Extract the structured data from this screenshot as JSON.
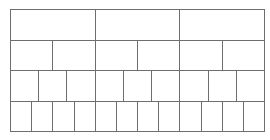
{
  "diagram": {
    "type": "subdivision-grid",
    "line_color": "#6e6e6e",
    "background": "#ffffff",
    "rows": [
      {
        "cells": 3
      },
      {
        "cells": 6
      },
      {
        "cells": 9
      },
      {
        "cells": 12
      }
    ]
  }
}
